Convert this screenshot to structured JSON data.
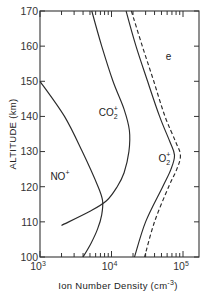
{
  "chart_data": {
    "type": "line",
    "title": "",
    "xlabel": "Ion Number Density (cm^-3)",
    "ylabel": "ALTITUDE (km)",
    "xscale": "log",
    "xlim": [
      1000,
      200000
    ],
    "ylim": [
      100,
      170
    ],
    "x_ticks": [
      {
        "value": 1000,
        "label": "10",
        "exp": "3"
      },
      {
        "value": 10000,
        "label": "10",
        "exp": "4"
      },
      {
        "value": 100000,
        "label": "10",
        "exp": "5"
      }
    ],
    "y_ticks": [
      100,
      110,
      120,
      130,
      140,
      150,
      160,
      170
    ],
    "grid": false,
    "legend": "inline labels",
    "series": [
      {
        "name": "NO+",
        "label": "NO",
        "charge": "+",
        "style": "solid",
        "points": [
          {
            "alt": 150,
            "n": 1000
          },
          {
            "alt": 140,
            "n": 2200
          },
          {
            "alt": 130,
            "n": 3900
          },
          {
            "alt": 120,
            "n": 6500
          },
          {
            "alt": 116,
            "n": 7500
          },
          {
            "alt": 112,
            "n": 7300
          },
          {
            "alt": 108,
            "n": 6400
          },
          {
            "alt": 104,
            "n": 5200
          },
          {
            "alt": 100,
            "n": 4000
          }
        ]
      },
      {
        "name": "CO2+",
        "label": "CO",
        "sub": "2",
        "charge": "+",
        "style": "solid",
        "points": [
          {
            "alt": 170,
            "n": 5300
          },
          {
            "alt": 160,
            "n": 7300
          },
          {
            "alt": 150,
            "n": 10500
          },
          {
            "alt": 142,
            "n": 15000
          },
          {
            "alt": 136,
            "n": 17800
          },
          {
            "alt": 130,
            "n": 17500
          },
          {
            "alt": 124,
            "n": 15000
          },
          {
            "alt": 120,
            "n": 12000
          },
          {
            "alt": 116,
            "n": 8500
          },
          {
            "alt": 113,
            "n": 5000
          },
          {
            "alt": 109,
            "n": 2000
          }
        ]
      },
      {
        "name": "O2+",
        "label": "O",
        "sub": "2",
        "charge": "+",
        "style": "solid",
        "points": [
          {
            "alt": 170,
            "n": 16000
          },
          {
            "alt": 160,
            "n": 22000
          },
          {
            "alt": 150,
            "n": 32000
          },
          {
            "alt": 140,
            "n": 47000
          },
          {
            "alt": 133,
            "n": 65000
          },
          {
            "alt": 129,
            "n": 76000
          },
          {
            "alt": 125,
            "n": 68000
          },
          {
            "alt": 120,
            "n": 52000
          },
          {
            "alt": 110,
            "n": 30000
          },
          {
            "alt": 100,
            "n": 21000
          }
        ]
      },
      {
        "name": "e",
        "label": "e",
        "style": "dashed",
        "points": [
          {
            "alt": 170,
            "n": 19000
          },
          {
            "alt": 160,
            "n": 27000
          },
          {
            "alt": 150,
            "n": 39000
          },
          {
            "alt": 140,
            "n": 56000
          },
          {
            "alt": 133,
            "n": 78000
          },
          {
            "alt": 129,
            "n": 92000
          },
          {
            "alt": 125,
            "n": 82000
          },
          {
            "alt": 120,
            "n": 63000
          },
          {
            "alt": 110,
            "n": 40000
          },
          {
            "alt": 100,
            "n": 29000
          }
        ]
      }
    ],
    "annotations": [
      {
        "text": "NO+",
        "alt": 122,
        "n": 1900
      },
      {
        "text": "CO2+",
        "alt": 140,
        "n": 9000
      },
      {
        "text": "O2+",
        "alt": 127,
        "n": 55000
      },
      {
        "text": "e",
        "alt": 156,
        "n": 63000
      }
    ],
    "colors": {
      "line": "#2a2a2a",
      "axis": "#333333",
      "background": "#ffffff"
    }
  }
}
